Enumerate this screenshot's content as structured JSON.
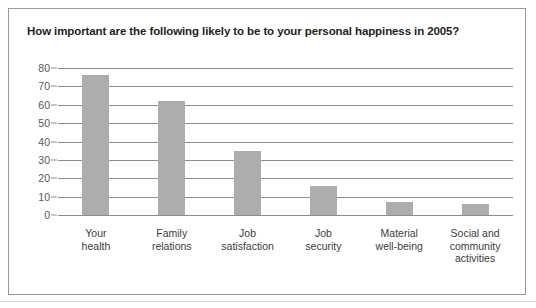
{
  "chart_data": {
    "type": "bar",
    "title": "How important are the following likely to be to your personal happiness in 2005?",
    "xlabel": "",
    "ylabel": "",
    "ylim": [
      0,
      80
    ],
    "ytick_step": 10,
    "yticks": [
      80,
      70,
      60,
      50,
      40,
      30,
      20,
      10,
      0
    ],
    "ytick_labels": [
      "80",
      "70",
      "60",
      "50",
      "40",
      "30",
      "20",
      "10",
      "0"
    ],
    "grid": true,
    "legend": false,
    "categories": [
      "Your health",
      "Family relations",
      "Job satisfaction",
      "Job security",
      "Material well-being",
      "Social and community activities"
    ],
    "category_lines": [
      [
        "Your",
        "health"
      ],
      [
        "Family",
        "relations"
      ],
      [
        "Job",
        "satisfaction"
      ],
      [
        "Job",
        "security"
      ],
      [
        "Material",
        "well-being"
      ],
      [
        "Social and",
        "community",
        "activities"
      ]
    ],
    "values": [
      76,
      62,
      35,
      16,
      7,
      6
    ],
    "bar_color": "#adadad",
    "grid_color": "#8d8d8d",
    "title_color": "#231f20",
    "tick_color": "#58595b",
    "frame_color": "#9a9a9a"
  }
}
